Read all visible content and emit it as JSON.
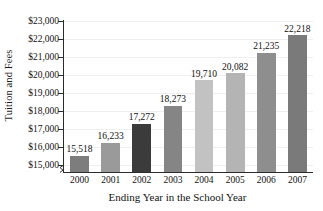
{
  "chart_data": {
    "type": "bar",
    "title": "",
    "xlabel": "Ending Year in the School Year",
    "ylabel": "Tuition and Fees",
    "categories": [
      "2000",
      "2001",
      "2002",
      "2003",
      "2004",
      "2005",
      "2006",
      "2007"
    ],
    "values": [
      15518,
      16233,
      17272,
      18273,
      19710,
      20082,
      21235,
      22218
    ],
    "value_labels": [
      "15,518",
      "16,233",
      "17,272",
      "18,273",
      "19,710",
      "20,082",
      "21,235",
      "22,218"
    ],
    "ylim": [
      14600,
      23000
    ],
    "ytick_values": [
      15000,
      16000,
      17000,
      18000,
      19000,
      20000,
      21000,
      22000,
      23000
    ],
    "ytick_labels": [
      "$15,000",
      "$16,000",
      "$17,000",
      "$18,000",
      "$19,000",
      "$20,000",
      "$21,000",
      "$22,000",
      "$23,000"
    ],
    "bar_colors": [
      "#7d7d7d",
      "#9a9a9a",
      "#3b3b3b",
      "#858585",
      "#c2c2c2",
      "#b4b4b4",
      "#8e8e8e",
      "#7a7a7a"
    ],
    "grid": "horizontal",
    "gridline_color": "#efefef",
    "axis_color": "#2b2b2b",
    "text_color": "#111111",
    "background": "#ffffff",
    "legend": "none",
    "axis_break": true
  }
}
